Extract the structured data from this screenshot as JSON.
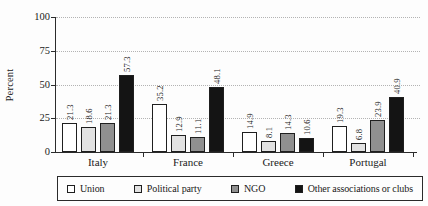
{
  "colors": {
    "background": "#fdfdfd",
    "axis": "#2b2b2b",
    "grid": "#b3b3b3",
    "text": "#1a1a1a",
    "bar_border": "#1f1f1f"
  },
  "chart_data": {
    "type": "bar",
    "title": "",
    "xlabel": "",
    "ylabel": "Percent",
    "ylim": [
      0,
      100
    ],
    "yticks": [
      0,
      25,
      50,
      75,
      100
    ],
    "grid": "horizontal dotted at 25, 50, 75, 100",
    "legend_position": "bottom boxed",
    "categories": [
      "Italy",
      "France",
      "Greece",
      "Portugal"
    ],
    "series": [
      {
        "name": "Union",
        "color": "#ffffff",
        "values": [
          21.3,
          35.2,
          14.9,
          19.3
        ]
      },
      {
        "name": "Political party",
        "color": "#e2e2e2",
        "values": [
          18.6,
          12.9,
          8.1,
          6.8
        ]
      },
      {
        "name": "NGO",
        "color": "#909090",
        "values": [
          21.3,
          11.1,
          14.3,
          23.9
        ]
      },
      {
        "name": "Other associations or clubs",
        "color": "#141414",
        "values": [
          57.3,
          48.1,
          10.6,
          40.9
        ]
      }
    ],
    "bar_value_labels": {
      "Italy": [
        21.3,
        18.6,
        21.3,
        57.3
      ],
      "France": [
        35.2,
        12.9,
        11.1,
        48.1
      ],
      "Greece": [
        14.9,
        8.1,
        14.3,
        10.6
      ],
      "Portugal": [
        19.3,
        6.8,
        23.9,
        40.9
      ]
    }
  }
}
